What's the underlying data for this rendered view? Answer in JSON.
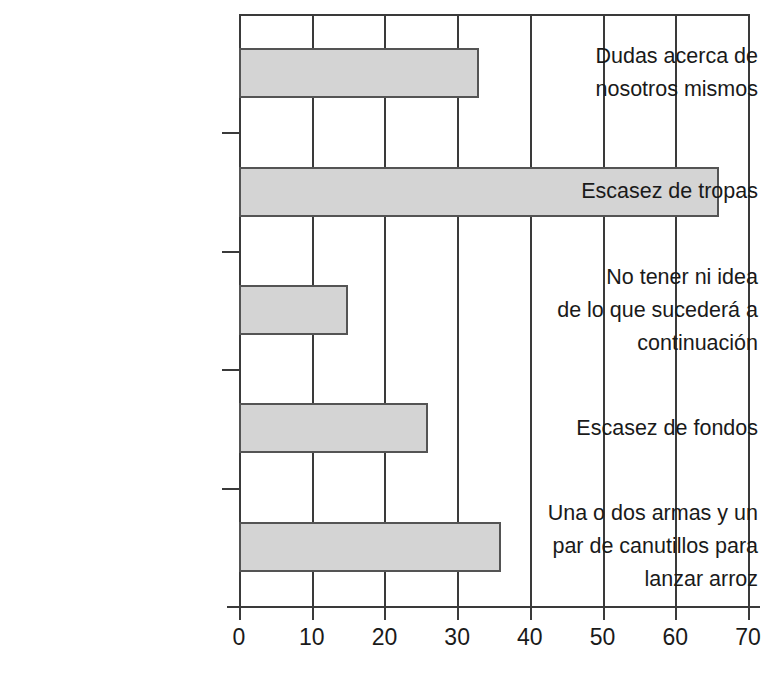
{
  "chart_data": {
    "type": "bar",
    "orientation": "horizontal",
    "title": "",
    "subtitle": "",
    "xlabel": "",
    "ylabel": "",
    "categories": [
      "Dudas acerca de nosotros mismos",
      "Escasez de tropas",
      "No tener ni idea de lo que sucederá a continuación",
      "Escasez de fondos",
      "Una o dos armas y un par de canutillos para lanzar arroz"
    ],
    "category_lines": [
      [
        "Dudas acerca de",
        "nosotros mismos"
      ],
      [
        "Escasez de tropas"
      ],
      [
        "No tener ni idea",
        "de lo que sucederá a",
        "continuación"
      ],
      [
        "Escasez de fondos"
      ],
      [
        "Una o dos armas y un",
        "par de canutillos para",
        "lanzar arroz"
      ]
    ],
    "values": [
      33,
      66,
      15,
      26,
      36
    ],
    "xlim": [
      0,
      70
    ],
    "xticks": [
      0,
      10,
      20,
      30,
      40,
      50,
      60,
      70
    ],
    "xticklabels": [
      "0",
      "10",
      "20",
      "30",
      "40",
      "50",
      "60",
      "70"
    ],
    "grid": true,
    "grid_axis": "x",
    "legend": false,
    "bar_fill_color": "#d4d4d4",
    "bar_border_color": "#545454",
    "axis_color": "#3a3a3a",
    "background_color": "#ffffff"
  }
}
